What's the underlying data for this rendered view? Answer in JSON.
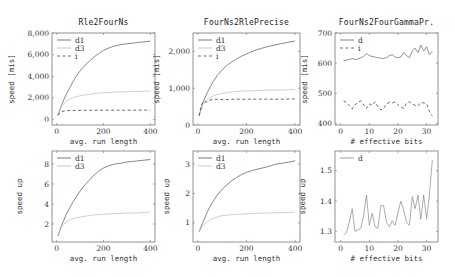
{
  "chart_data": [
    {
      "id": "p00",
      "type": "line",
      "title": "Rle2FourNs",
      "xlabel": "avg. run length",
      "ylabel": "speed [mis]",
      "xlim": [
        -20,
        420
      ],
      "ylim": [
        -500,
        8000
      ],
      "xticks": [
        0,
        200,
        400
      ],
      "xticklabels": [
        "0",
        "200",
        "400"
      ],
      "yticks": [
        0,
        2000,
        4000,
        6000,
        8000
      ],
      "yticklabels": [
        "0",
        "2,000",
        "4,000",
        "6,000",
        "8,000"
      ],
      "frame": {
        "x": 52,
        "y": 33,
        "w": 103,
        "h": 92
      },
      "legend": [
        "d1",
        "d3",
        "i"
      ],
      "series": [
        {
          "name": "d1",
          "style": "solid",
          "color": "#555555",
          "x": [
            5,
            20,
            40,
            60,
            80,
            100,
            120,
            140,
            160,
            180,
            200,
            220,
            240,
            260,
            280,
            300,
            320,
            340,
            360,
            380,
            400
          ],
          "y": [
            400,
            1300,
            2300,
            3100,
            3900,
            4500,
            5000,
            5400,
            5800,
            6100,
            6400,
            6600,
            6750,
            6850,
            6950,
            7000,
            7050,
            7100,
            7150,
            7200,
            7250
          ]
        },
        {
          "name": "d3",
          "style": "solid",
          "color": "#bbbbbb",
          "x": [
            5,
            20,
            40,
            60,
            80,
            100,
            140,
            180,
            220,
            260,
            300,
            340,
            380,
            400
          ],
          "y": [
            400,
            1200,
            1700,
            1950,
            2100,
            2200,
            2350,
            2450,
            2500,
            2550,
            2580,
            2600,
            2620,
            2650
          ]
        },
        {
          "name": "i",
          "style": "dashed",
          "color": "#444444",
          "x": [
            5,
            20,
            40,
            80,
            120,
            200,
            300,
            400
          ],
          "y": [
            400,
            750,
            820,
            850,
            860,
            870,
            870,
            880
          ]
        }
      ]
    },
    {
      "id": "p01",
      "type": "line",
      "title": "FourNs2RlePrecise",
      "xlabel": "avg. run length",
      "ylabel": "speed [mis]",
      "xlim": [
        -20,
        420
      ],
      "ylim": [
        0,
        2500
      ],
      "xticks": [
        0,
        200,
        400
      ],
      "xticklabels": [
        "0",
        "200",
        "400"
      ],
      "yticks": [
        0,
        1000,
        2000
      ],
      "yticklabels": [
        "0",
        "1,000",
        "2,000"
      ],
      "frame": {
        "x": 193,
        "y": 33,
        "w": 107,
        "h": 92
      },
      "legend": [
        "d1",
        "d3",
        "i"
      ],
      "series": [
        {
          "name": "d1",
          "style": "solid",
          "color": "#555555",
          "x": [
            5,
            20,
            40,
            60,
            80,
            100,
            120,
            140,
            160,
            180,
            200,
            220,
            240,
            260,
            280,
            300,
            320,
            340,
            360,
            380,
            400
          ],
          "y": [
            250,
            600,
            900,
            1150,
            1350,
            1500,
            1620,
            1720,
            1800,
            1870,
            1930,
            1990,
            2040,
            2080,
            2120,
            2150,
            2180,
            2210,
            2230,
            2260,
            2280
          ]
        },
        {
          "name": "d3",
          "style": "solid",
          "color": "#bbbbbb",
          "x": [
            5,
            20,
            40,
            60,
            80,
            100,
            140,
            180,
            220,
            260,
            300,
            340,
            380,
            400
          ],
          "y": [
            250,
            550,
            700,
            780,
            830,
            860,
            900,
            920,
            930,
            940,
            950,
            950,
            960,
            970
          ]
        },
        {
          "name": "i",
          "style": "dashed",
          "color": "#444444",
          "x": [
            5,
            15,
            25,
            35,
            50,
            70,
            100,
            150,
            200,
            250,
            300,
            350,
            400
          ],
          "y": [
            250,
            550,
            650,
            620,
            680,
            700,
            690,
            700,
            700,
            705,
            700,
            700,
            710
          ]
        }
      ]
    },
    {
      "id": "p02",
      "type": "line",
      "title": "FourNs2FourGammaPr.",
      "xlabel": "# effective bits",
      "ylabel": "speed [mis]",
      "xlim": [
        -2,
        34
      ],
      "ylim": [
        395,
        700
      ],
      "xticks": [
        0,
        10,
        20,
        30
      ],
      "xticklabels": [
        "0",
        "10",
        "20",
        "30"
      ],
      "yticks": [
        400,
        500,
        600,
        700
      ],
      "yticklabels": [
        "400",
        "500",
        "600",
        "700"
      ],
      "frame": {
        "x": 335,
        "y": 33,
        "w": 103,
        "h": 92
      },
      "legend": [
        "d",
        "i"
      ],
      "series": [
        {
          "name": "d",
          "style": "solid",
          "color": "#666666",
          "x": [
            1,
            2,
            3,
            4,
            5,
            6,
            7,
            8,
            9,
            10,
            11,
            12,
            13,
            14,
            15,
            16,
            17,
            18,
            19,
            20,
            21,
            22,
            23,
            24,
            25,
            26,
            27,
            28,
            29,
            30,
            31,
            32
          ],
          "y": [
            608,
            610,
            612,
            615,
            612,
            614,
            618,
            622,
            632,
            625,
            622,
            620,
            618,
            616,
            615,
            618,
            625,
            628,
            620,
            618,
            620,
            635,
            625,
            618,
            640,
            650,
            635,
            660,
            640,
            655,
            628,
            640
          ]
        },
        {
          "name": "i",
          "style": "dashed",
          "color": "#444444",
          "x": [
            1,
            2,
            3,
            4,
            5,
            6,
            7,
            8,
            9,
            10,
            11,
            12,
            13,
            14,
            15,
            16,
            17,
            18,
            19,
            20,
            21,
            22,
            23,
            24,
            25,
            26,
            27,
            28,
            29,
            30,
            31,
            32
          ],
          "y": [
            475,
            470,
            460,
            448,
            462,
            470,
            475,
            462,
            450,
            465,
            460,
            472,
            455,
            445,
            450,
            465,
            470,
            468,
            472,
            462,
            455,
            450,
            468,
            472,
            465,
            460,
            458,
            470,
            468,
            465,
            440,
            425
          ]
        }
      ]
    },
    {
      "id": "p10",
      "type": "line",
      "title": "",
      "xlabel": "avg. run length",
      "ylabel": "speed up",
      "xlim": [
        -20,
        420
      ],
      "ylim": [
        0.2,
        9.3
      ],
      "xticks": [
        0,
        200,
        400
      ],
      "xticklabels": [
        "0",
        "200",
        "400"
      ],
      "yticks": [
        2,
        4,
        6,
        8
      ],
      "yticklabels": [
        "2",
        "4",
        "6",
        "8"
      ],
      "frame": {
        "x": 52,
        "y": 151,
        "w": 103,
        "h": 91
      },
      "legend": [
        "d1",
        "d3"
      ],
      "series": [
        {
          "name": "d1",
          "style": "solid",
          "color": "#555555",
          "x": [
            5,
            20,
            40,
            60,
            80,
            100,
            120,
            140,
            160,
            180,
            200,
            220,
            240,
            260,
            280,
            300,
            320,
            340,
            360,
            380,
            400
          ],
          "y": [
            0.8,
            1.8,
            2.9,
            3.8,
            4.6,
            5.3,
            5.9,
            6.4,
            6.9,
            7.3,
            7.6,
            7.8,
            7.95,
            8.05,
            8.1,
            8.2,
            8.25,
            8.3,
            8.35,
            8.4,
            8.45
          ]
        },
        {
          "name": "d3",
          "style": "solid",
          "color": "#bbbbbb",
          "x": [
            5,
            20,
            40,
            60,
            80,
            100,
            140,
            180,
            220,
            260,
            300,
            340,
            380,
            400
          ],
          "y": [
            0.8,
            1.7,
            2.2,
            2.45,
            2.6,
            2.7,
            2.85,
            2.95,
            3.0,
            3.05,
            3.1,
            3.1,
            3.15,
            3.2
          ]
        }
      ]
    },
    {
      "id": "p11",
      "type": "line",
      "title": "",
      "xlabel": "avg. run length",
      "ylabel": "speed up",
      "xlim": [
        -20,
        420
      ],
      "ylim": [
        0.35,
        3.45
      ],
      "xticks": [
        0,
        200,
        400
      ],
      "xticklabels": [
        "0",
        "200",
        "400"
      ],
      "yticks": [
        1,
        2,
        3
      ],
      "yticklabels": [
        "1",
        "2",
        "3"
      ],
      "frame": {
        "x": 193,
        "y": 151,
        "w": 107,
        "h": 91
      },
      "legend": [
        "d1",
        "d3"
      ],
      "series": [
        {
          "name": "d1",
          "style": "solid",
          "color": "#555555",
          "x": [
            5,
            20,
            40,
            60,
            80,
            100,
            120,
            140,
            160,
            180,
            200,
            220,
            240,
            260,
            280,
            300,
            320,
            340,
            360,
            380,
            400
          ],
          "y": [
            0.7,
            1.0,
            1.4,
            1.7,
            1.95,
            2.15,
            2.3,
            2.45,
            2.55,
            2.65,
            2.72,
            2.78,
            2.82,
            2.86,
            2.9,
            2.95,
            3.0,
            3.02,
            3.05,
            3.08,
            3.12
          ]
        },
        {
          "name": "d3",
          "style": "solid",
          "color": "#bbbbbb",
          "x": [
            5,
            20,
            40,
            60,
            80,
            100,
            140,
            180,
            220,
            260,
            300,
            340,
            380,
            400
          ],
          "y": [
            0.7,
            0.9,
            1.05,
            1.15,
            1.2,
            1.25,
            1.28,
            1.3,
            1.32,
            1.33,
            1.34,
            1.35,
            1.36,
            1.37
          ]
        }
      ]
    },
    {
      "id": "p12",
      "type": "line",
      "title": "",
      "xlabel": "# effective bits",
      "ylabel": "speed up",
      "xlim": [
        -2,
        34
      ],
      "ylim": [
        1.265,
        1.565
      ],
      "xticks": [
        0,
        10,
        20,
        30
      ],
      "xticklabels": [
        "0",
        "10",
        "20",
        "30"
      ],
      "yticks": [
        1.3,
        1.4,
        1.5
      ],
      "yticklabels": [
        "1.3",
        "1.4",
        "1.5"
      ],
      "frame": {
        "x": 335,
        "y": 151,
        "w": 103,
        "h": 91
      },
      "legend": [
        "d"
      ],
      "series": [
        {
          "name": "d",
          "style": "solid",
          "color": "#888888",
          "x": [
            1,
            2,
            3,
            4,
            5,
            6,
            7,
            8,
            9,
            10,
            11,
            12,
            13,
            14,
            15,
            16,
            17,
            18,
            19,
            20,
            21,
            22,
            23,
            24,
            25,
            26,
            27,
            28,
            29,
            30,
            31,
            32
          ],
          "y": [
            1.29,
            1.295,
            1.33,
            1.375,
            1.3,
            1.305,
            1.31,
            1.35,
            1.42,
            1.32,
            1.36,
            1.315,
            1.31,
            1.385,
            1.385,
            1.33,
            1.315,
            1.335,
            1.32,
            1.36,
            1.4,
            1.37,
            1.33,
            1.32,
            1.415,
            1.375,
            1.42,
            1.34,
            1.42,
            1.34,
            1.42,
            1.535
          ]
        }
      ]
    }
  ]
}
